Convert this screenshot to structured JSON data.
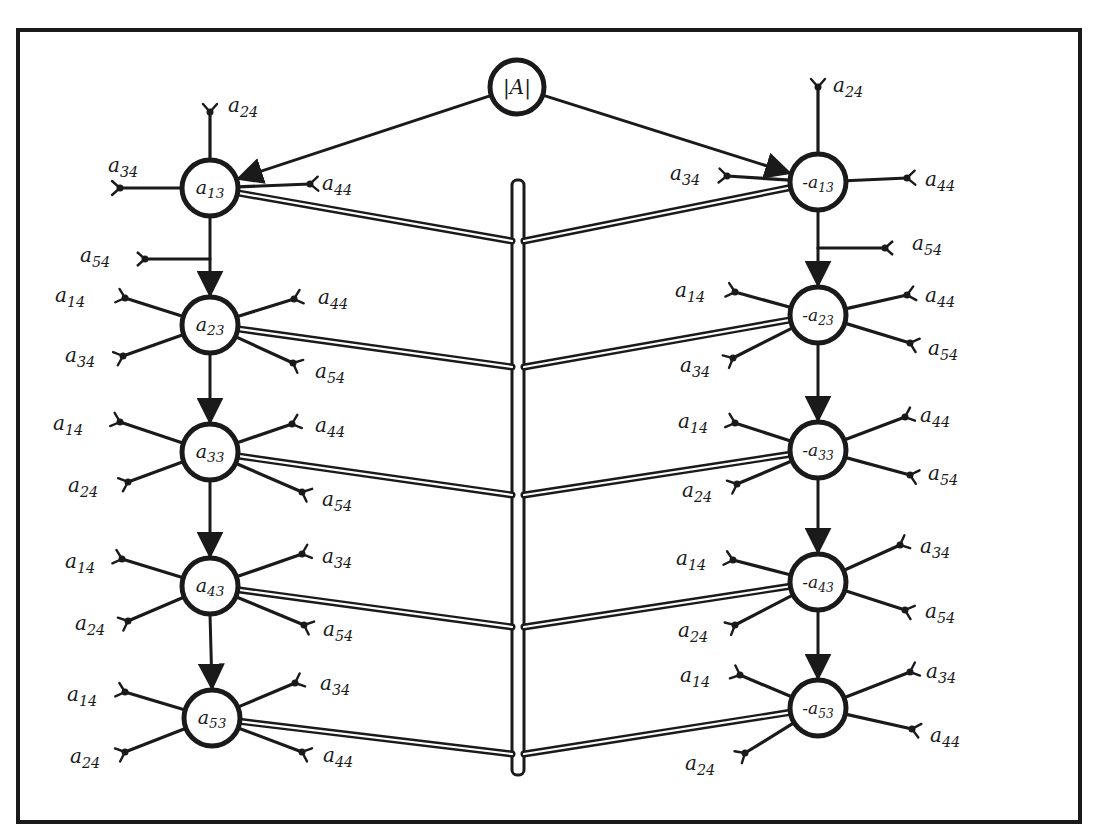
{
  "diagram": {
    "colors": {
      "ink": "#1a1a1a",
      "paper": "#ffffff"
    },
    "frame": {
      "x": 18,
      "y": 30,
      "w": 1062,
      "h": 792
    },
    "root": {
      "id": "detA",
      "label": "|A|",
      "x": 517,
      "y": 87,
      "r": 27
    },
    "bus": {
      "x": 518,
      "y1": 180,
      "y2": 775,
      "width": 12
    },
    "columns": [
      {
        "side": "left",
        "nodes": [
          {
            "id": "a13",
            "label": "a13",
            "main": "a",
            "sub": "13",
            "x": 210,
            "y": 188,
            "inputs": [
              {
                "label": "a24",
                "main": "a",
                "sub": "24",
                "ex": 210,
                "ey": 112,
                "lx": 228,
                "ly": 112
              },
              {
                "label": "a34",
                "main": "a",
                "sub": "34",
                "ex": 120,
                "ey": 188,
                "lx": 108,
                "ly": 172
              },
              {
                "label": "a44",
                "main": "a",
                "sub": "44",
                "ex": 310,
                "ey": 184,
                "lx": 322,
                "ly": 190
              }
            ]
          },
          {
            "id": "a23",
            "label": "a23",
            "main": "a",
            "sub": "23",
            "x": 210,
            "y": 325,
            "inputs": [
              {
                "label": "a14",
                "main": "a",
                "sub": "14",
                "ex": 125,
                "ey": 298,
                "lx": 55,
                "ly": 302
              },
              {
                "label": "a34",
                "main": "a",
                "sub": "34",
                "ex": 123,
                "ey": 356,
                "lx": 65,
                "ly": 362
              },
              {
                "label": "a44",
                "main": "a",
                "sub": "44",
                "ex": 294,
                "ey": 299,
                "lx": 318,
                "ly": 304
              },
              {
                "label": "a54",
                "main": "a",
                "sub": "54",
                "ex": 293,
                "ey": 363,
                "lx": 315,
                "ly": 378
              }
            ]
          },
          {
            "id": "a33",
            "label": "a33",
            "main": "a",
            "sub": "33",
            "x": 210,
            "y": 452,
            "inputs": [
              {
                "label": "a14",
                "main": "a",
                "sub": "14",
                "ex": 120,
                "ey": 422,
                "lx": 53,
                "ly": 430
              },
              {
                "label": "a24",
                "main": "a",
                "sub": "24",
                "ex": 128,
                "ey": 482,
                "lx": 68,
                "ly": 492
              },
              {
                "label": "a44",
                "main": "a",
                "sub": "44",
                "ex": 292,
                "ey": 424,
                "lx": 315,
                "ly": 432
              },
              {
                "label": "a54",
                "main": "a",
                "sub": "54",
                "ex": 302,
                "ey": 492,
                "lx": 322,
                "ly": 506
              }
            ]
          },
          {
            "id": "a43",
            "label": "a43",
            "main": "a",
            "sub": "43",
            "x": 210,
            "y": 586,
            "inputs": [
              {
                "label": "a14",
                "main": "a",
                "sub": "14",
                "ex": 122,
                "ey": 559,
                "lx": 65,
                "ly": 568
              },
              {
                "label": "a24",
                "main": "a",
                "sub": "24",
                "ex": 128,
                "ey": 621,
                "lx": 75,
                "ly": 630
              },
              {
                "label": "a34",
                "main": "a",
                "sub": "34",
                "ex": 302,
                "ey": 554,
                "lx": 322,
                "ly": 563
              },
              {
                "label": "a54",
                "main": "a",
                "sub": "54",
                "ex": 304,
                "ey": 625,
                "lx": 323,
                "ly": 636
              }
            ]
          },
          {
            "id": "a53",
            "label": "a53",
            "main": "a",
            "sub": "53",
            "x": 212,
            "y": 718,
            "inputs": [
              {
                "label": "a14",
                "main": "a",
                "sub": "14",
                "ex": 125,
                "ey": 692,
                "lx": 67,
                "ly": 701
              },
              {
                "label": "a24",
                "main": "a",
                "sub": "24",
                "ex": 125,
                "ey": 752,
                "lx": 70,
                "ly": 763
              },
              {
                "label": "a34",
                "main": "a",
                "sub": "34",
                "ex": 295,
                "ey": 683,
                "lx": 320,
                "ly": 690
              },
              {
                "label": "a44",
                "main": "a",
                "sub": "44",
                "ex": 302,
                "ey": 752,
                "lx": 323,
                "ly": 762
              }
            ]
          }
        ],
        "extra_inputs": [
          {
            "label": "a54",
            "main": "a",
            "sub": "54",
            "ex": 145,
            "ey": 259,
            "jx": 210,
            "jy": 259,
            "lx": 80,
            "ly": 262
          }
        ]
      },
      {
        "side": "right",
        "nodes": [
          {
            "id": "neg_a13",
            "label": "-a13",
            "main": "-a",
            "sub": "13",
            "x": 818,
            "y": 182,
            "inputs": [
              {
                "label": "a24",
                "main": "a",
                "sub": "24",
                "ex": 818,
                "ey": 87,
                "lx": 833,
                "ly": 92
              },
              {
                "label": "a34",
                "main": "a",
                "sub": "34",
                "ex": 727,
                "ey": 176,
                "lx": 670,
                "ly": 180
              },
              {
                "label": "a44",
                "main": "a",
                "sub": "44",
                "ex": 907,
                "ey": 178,
                "lx": 925,
                "ly": 186
              }
            ]
          },
          {
            "id": "neg_a23",
            "label": "-a23",
            "main": "-a",
            "sub": "23",
            "x": 818,
            "y": 315,
            "inputs": [
              {
                "label": "a14",
                "main": "a",
                "sub": "14",
                "ex": 735,
                "ey": 292,
                "lx": 675,
                "ly": 297
              },
              {
                "label": "a34",
                "main": "a",
                "sub": "34",
                "ex": 733,
                "ey": 358,
                "lx": 680,
                "ly": 372
              },
              {
                "label": "a44",
                "main": "a",
                "sub": "44",
                "ex": 907,
                "ey": 295,
                "lx": 925,
                "ly": 302
              },
              {
                "label": "a54",
                "main": "a",
                "sub": "54",
                "ex": 910,
                "ey": 343,
                "lx": 928,
                "ly": 355
              }
            ]
          },
          {
            "id": "neg_a33",
            "label": "-a33",
            "main": "-a",
            "sub": "33",
            "x": 818,
            "y": 450,
            "inputs": [
              {
                "label": "a14",
                "main": "a",
                "sub": "14",
                "ex": 735,
                "ey": 423,
                "lx": 678,
                "ly": 428
              },
              {
                "label": "a24",
                "main": "a",
                "sub": "24",
                "ex": 737,
                "ey": 484,
                "lx": 682,
                "ly": 497
              },
              {
                "label": "a44",
                "main": "a",
                "sub": "44",
                "ex": 905,
                "ey": 417,
                "lx": 920,
                "ly": 422
              },
              {
                "label": "a54",
                "main": "a",
                "sub": "54",
                "ex": 910,
                "ey": 475,
                "lx": 928,
                "ly": 480
              }
            ]
          },
          {
            "id": "neg_a43",
            "label": "-a43",
            "main": "-a",
            "sub": "43",
            "x": 818,
            "y": 582,
            "inputs": [
              {
                "label": "a14",
                "main": "a",
                "sub": "14",
                "ex": 733,
                "ey": 560,
                "lx": 676,
                "ly": 565
              },
              {
                "label": "a24",
                "main": "a",
                "sub": "24",
                "ex": 735,
                "ey": 625,
                "lx": 678,
                "ly": 637
              },
              {
                "label": "a34",
                "main": "a",
                "sub": "34",
                "ex": 900,
                "ey": 545,
                "lx": 920,
                "ly": 553
              },
              {
                "label": "a54",
                "main": "a",
                "sub": "54",
                "ex": 905,
                "ey": 610,
                "lx": 925,
                "ly": 618
              }
            ]
          },
          {
            "id": "neg_a53",
            "label": "-a53",
            "main": "-a",
            "sub": "53",
            "x": 818,
            "y": 708,
            "inputs": [
              {
                "label": "a14",
                "main": "a",
                "sub": "14",
                "ex": 740,
                "ey": 675,
                "lx": 680,
                "ly": 682
              },
              {
                "label": "a24",
                "main": "a",
                "sub": "24",
                "ex": 745,
                "ey": 753,
                "lx": 685,
                "ly": 770
              },
              {
                "label": "a34",
                "main": "a",
                "sub": "34",
                "ex": 910,
                "ey": 672,
                "lx": 926,
                "ly": 678
              },
              {
                "label": "a44",
                "main": "a",
                "sub": "44",
                "ex": 912,
                "ey": 729,
                "lx": 930,
                "ly": 742
              }
            ]
          }
        ],
        "extra_inputs": [
          {
            "label": "a54",
            "main": "a",
            "sub": "54",
            "ex": 885,
            "ey": 248,
            "jx": 818,
            "jy": 248,
            "lx": 912,
            "ly": 250
          }
        ]
      }
    ],
    "bus_joins_y": [
      241,
      367,
      495,
      627,
      754
    ],
    "node_radius": 28
  }
}
